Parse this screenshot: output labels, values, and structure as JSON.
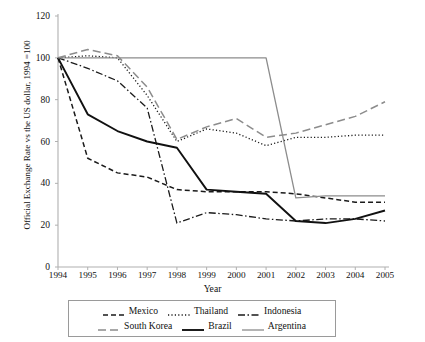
{
  "chart_data": {
    "type": "line",
    "title": "",
    "xlabel": "Year",
    "ylabel": "Official Exchange Rate vs the US dollar, 1994 =100",
    "x": [
      1994,
      1995,
      1996,
      1997,
      1998,
      1999,
      2000,
      2001,
      2002,
      2003,
      2004,
      2005
    ],
    "xtick_labels": [
      "1994",
      "1995",
      "1996",
      "1997",
      "1998",
      "1999",
      "2000",
      "2001",
      "2002",
      "2003",
      "2004",
      "2005"
    ],
    "ytick_labels": [
      "0",
      "20",
      "40",
      "60",
      "80",
      "100",
      "120"
    ],
    "ytick_values": [
      0,
      20,
      40,
      60,
      80,
      100,
      120
    ],
    "xlim": [
      1994,
      2005
    ],
    "ylim": [
      0,
      120
    ],
    "grid": false,
    "legend_position": "bottom",
    "series": [
      {
        "name": "Mexico",
        "style": "dashed",
        "color": "#1a1a1a",
        "width": 1.5,
        "dash": "5,3",
        "values": [
          100,
          52,
          45,
          43,
          37,
          36,
          36,
          36,
          35,
          33,
          31,
          31
        ]
      },
      {
        "name": "Thailand",
        "style": "dotted",
        "color": "#1a1a1a",
        "width": 1.3,
        "dash": "1.2,2.2",
        "values": [
          100,
          101,
          100,
          82,
          60,
          66,
          64,
          58,
          62,
          62,
          63,
          63
        ]
      },
      {
        "name": "Indonesia",
        "style": "dash-dot",
        "color": "#1a1a1a",
        "width": 1.3,
        "dash": "7,2.5,1.5,2.5",
        "values": [
          100,
          95,
          89,
          76,
          21,
          26,
          25,
          23,
          22,
          23,
          23,
          22
        ]
      },
      {
        "name": "South Korea",
        "style": "long-dash",
        "color": "#8c8c8c",
        "width": 1.5,
        "dash": "8,4",
        "values": [
          100,
          104,
          101,
          86,
          61,
          67,
          71,
          62,
          64,
          68,
          72,
          79
        ]
      },
      {
        "name": "Brazil",
        "style": "solid",
        "color": "#111111",
        "width": 1.9,
        "dash": "",
        "values": [
          100,
          73,
          65,
          60,
          57,
          37,
          36,
          35,
          22,
          21,
          23,
          27
        ]
      },
      {
        "name": "Argentina",
        "style": "solid",
        "color": "#8c8c8c",
        "width": 1.3,
        "dash": "",
        "values": [
          100,
          100,
          100,
          100,
          100,
          100,
          100,
          100,
          33,
          34,
          34,
          34
        ]
      }
    ]
  },
  "axis": {
    "line_color": "#b0b0b0"
  }
}
